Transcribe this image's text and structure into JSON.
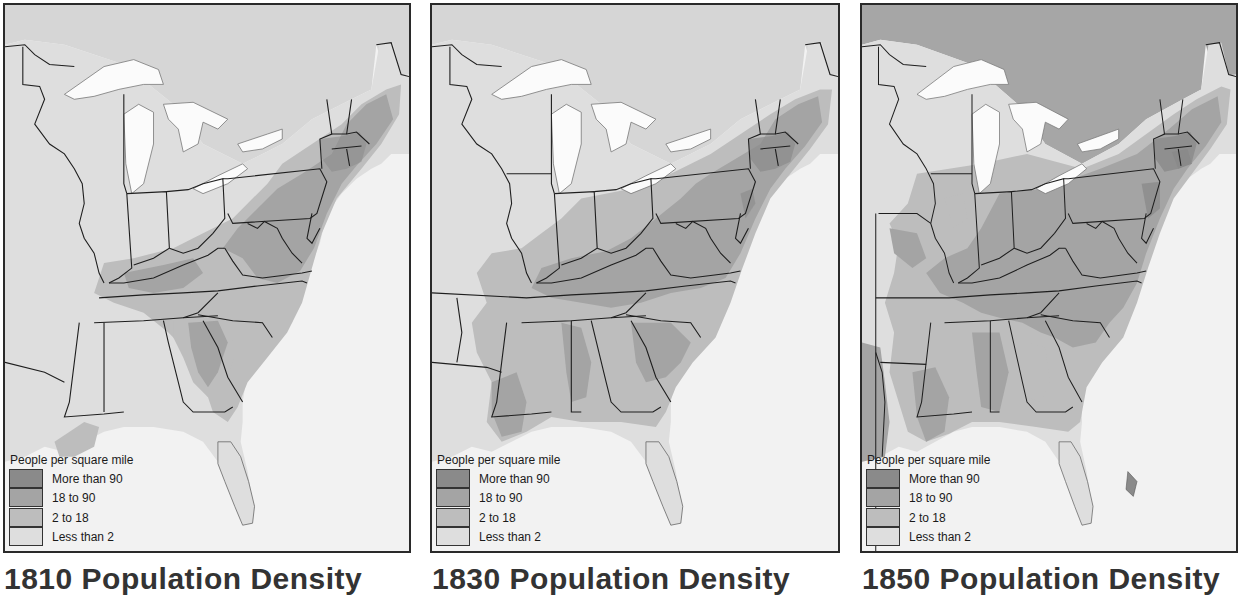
{
  "figure": {
    "panels": [
      {
        "year": "1810",
        "title": "1810 Population Density",
        "legend": {
          "title": "People per square mile",
          "items": [
            {
              "label": "More than 90",
              "color": "#8a8a8a"
            },
            {
              "label": "18 to 90",
              "color": "#a4a4a4"
            },
            {
              "label": "2 to 18",
              "color": "#bdbdbd"
            },
            {
              "label": "Less than 2",
              "color": "#dedede"
            }
          ]
        }
      },
      {
        "year": "1830",
        "title": "1830 Population Density",
        "legend": {
          "title": "People per square mile",
          "items": [
            {
              "label": "More than 90",
              "color": "#8a8a8a"
            },
            {
              "label": "18 to 90",
              "color": "#a4a4a4"
            },
            {
              "label": "2 to 18",
              "color": "#bdbdbd"
            },
            {
              "label": "Less than 2",
              "color": "#dedede"
            }
          ]
        }
      },
      {
        "year": "1850",
        "title": "1850 Population Density",
        "legend": {
          "title": "People per square mile",
          "items": [
            {
              "label": "More than 90",
              "color": "#8a8a8a"
            },
            {
              "label": "18 to 90",
              "color": "#a4a4a4"
            },
            {
              "label": "2 to 18",
              "color": "#bdbdbd"
            },
            {
              "label": "Less than 2",
              "color": "#dedede"
            }
          ]
        }
      }
    ],
    "colors": {
      "water": "#f2f2f2",
      "lakes": "#fbfbfb",
      "foreign_land_1810_1830": "#d6d6d6",
      "foreign_land_1850": "#a6a6a6",
      "borders": "#1e1e1e"
    }
  }
}
